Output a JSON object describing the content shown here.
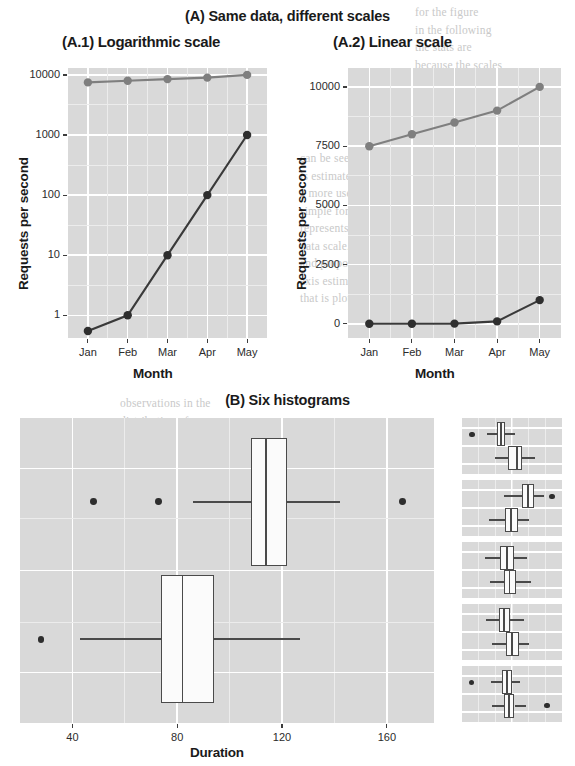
{
  "figure": {
    "title_a": "(A) Same data, different scales",
    "title_a1": "(A.1) Logarithmic scale",
    "title_a2": "(A.2) Linear scale",
    "title_b": "(B) Six histograms"
  },
  "ghost_text": {
    "lines": [
      "for the figure",
      "in the following",
      "the stats are",
      "because the scales",
      "of the data",
      "can be seen at",
      "is estimated as",
      "a more useful to",
      "simple for a com",
      "represents more",
      "data scale. Thus",
      "and proportion we",
      "axis estimation of",
      "that is plotted in the",
      "observations in the",
      "distribution of",
      "values in the da"
    ]
  },
  "chart_data": [
    {
      "id": "a1",
      "type": "line",
      "title": "(A.1) Logarithmic scale",
      "xlabel": "Month",
      "ylabel": "Requests per second",
      "categories": [
        "Jan",
        "Feb",
        "Mar",
        "Apr",
        "May"
      ],
      "yscale": "log",
      "yticks": [
        1,
        10,
        100,
        1000,
        10000
      ],
      "ytick_labels": [
        "1",
        "10",
        "100",
        "1000",
        "10000"
      ],
      "ylim": [
        0.42,
        13000
      ],
      "grid": true,
      "legend": "none",
      "series": [
        {
          "name": "flat",
          "color": "#7f7f7f",
          "values": [
            7500,
            8000,
            8500,
            9000,
            10000
          ]
        },
        {
          "name": "growth",
          "color": "#2e2e2e",
          "values": [
            0.55,
            1,
            10,
            100,
            1000
          ]
        }
      ]
    },
    {
      "id": "a2",
      "type": "line",
      "title": "(A.2) Linear scale",
      "xlabel": "Month",
      "ylabel": "Requests per second",
      "categories": [
        "Jan",
        "Feb",
        "Mar",
        "Apr",
        "May"
      ],
      "yscale": "linear",
      "yticks": [
        0,
        2500,
        5000,
        7500,
        10000
      ],
      "ytick_labels": [
        "0",
        "2500",
        "5000",
        "7500",
        "10000"
      ],
      "ylim": [
        -600,
        10800
      ],
      "grid": true,
      "legend": "none",
      "series": [
        {
          "name": "flat",
          "color": "#7f7f7f",
          "values": [
            7500,
            8000,
            8500,
            9000,
            10000
          ]
        },
        {
          "name": "growth",
          "color": "#2e2e2e",
          "values": [
            0.55,
            1,
            10,
            100,
            1000
          ]
        }
      ]
    },
    {
      "id": "b-main",
      "type": "boxplot",
      "title": "(B) Six histograms",
      "xlabel": "Duration",
      "xticks": [
        40,
        80,
        120,
        160
      ],
      "xtick_labels": [
        "40",
        "80",
        "120",
        "160"
      ],
      "xlim": [
        20,
        178
      ],
      "grid": true,
      "boxes": [
        {
          "name": "upper",
          "min": 86,
          "q1": 108,
          "median": 114,
          "q3": 122,
          "max": 142,
          "outliers": [
            48,
            73,
            166
          ]
        },
        {
          "name": "lower",
          "min": 43,
          "q1": 74,
          "median": 82,
          "q3": 94,
          "max": 127,
          "outliers": [
            28
          ]
        }
      ]
    },
    {
      "id": "b-facet-1",
      "type": "boxplot",
      "xticks": [
        40,
        80,
        120
      ],
      "xlim": [
        20,
        140
      ],
      "boxes": [
        {
          "name": "upper",
          "min": 50,
          "q1": 62,
          "median": 67,
          "q3": 72,
          "max": 84,
          "outliers": [
            32
          ]
        },
        {
          "name": "lower",
          "min": 59,
          "q1": 75,
          "median": 86,
          "q3": 92,
          "max": 108,
          "outliers": []
        }
      ]
    },
    {
      "id": "b-facet-2",
      "type": "boxplot",
      "xticks": [
        40,
        80,
        120
      ],
      "xlim": [
        20,
        140
      ],
      "boxes": [
        {
          "name": "upper",
          "min": 70,
          "q1": 92,
          "median": 99,
          "q3": 106,
          "max": 118,
          "outliers": [
            128
          ]
        },
        {
          "name": "lower",
          "min": 52,
          "q1": 72,
          "median": 79,
          "q3": 87,
          "max": 100,
          "outliers": []
        }
      ]
    },
    {
      "id": "b-facet-3",
      "type": "boxplot",
      "xticks": [
        40,
        80,
        120
      ],
      "xlim": [
        20,
        140
      ],
      "boxes": [
        {
          "name": "upper",
          "min": 48,
          "q1": 66,
          "median": 74,
          "q3": 82,
          "max": 98,
          "outliers": []
        },
        {
          "name": "lower",
          "min": 54,
          "q1": 70,
          "median": 77,
          "q3": 85,
          "max": 103,
          "outliers": []
        }
      ]
    },
    {
      "id": "b-facet-4",
      "type": "boxplot",
      "xticks": [
        40,
        80,
        120
      ],
      "xlim": [
        20,
        140
      ],
      "boxes": [
        {
          "name": "upper",
          "min": 49,
          "q1": 64,
          "median": 70,
          "q3": 78,
          "max": 95,
          "outliers": []
        },
        {
          "name": "lower",
          "min": 56,
          "q1": 73,
          "median": 80,
          "q3": 88,
          "max": 101,
          "outliers": []
        }
      ]
    },
    {
      "id": "b-facet-5",
      "type": "boxplot",
      "xlabel": "Duration",
      "xticks": [
        40,
        80,
        120
      ],
      "xtick_labels": [
        "40",
        "80",
        "120"
      ],
      "xlim": [
        20,
        140
      ],
      "boxes": [
        {
          "name": "upper",
          "min": 55,
          "q1": 68,
          "median": 74,
          "q3": 80,
          "max": 90,
          "outliers": [
            31
          ]
        },
        {
          "name": "lower",
          "min": 56,
          "q1": 70,
          "median": 76,
          "q3": 83,
          "max": 97,
          "outliers": [
            122
          ]
        }
      ]
    }
  ]
}
